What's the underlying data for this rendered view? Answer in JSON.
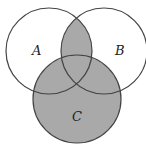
{
  "diagram": {
    "type": "venn",
    "shaded_region": "(A ∩ B) ∪ C",
    "colors": {
      "shade": "#a9a9a9",
      "stroke": "#444444",
      "background": "#ffffff"
    },
    "sets": [
      {
        "label": "A",
        "cx": 49,
        "cy": 51,
        "r": 43
      },
      {
        "label": "B",
        "cx": 104,
        "cy": 51,
        "r": 43
      },
      {
        "label": "C",
        "cx": 77,
        "cy": 99,
        "r": 44
      }
    ],
    "labels": [
      {
        "text": "A",
        "x": 32,
        "y": 55
      },
      {
        "text": "B",
        "x": 115,
        "y": 55
      },
      {
        "text": "C",
        "x": 72,
        "y": 121
      }
    ]
  }
}
